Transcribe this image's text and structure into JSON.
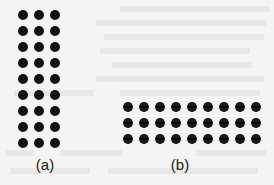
{
  "figure": {
    "background_color": "#f5f4f2",
    "dot_color": "#121212",
    "label_color": "#1a1a1a",
    "dot_diameter_px": 10,
    "grid_pitch_px": 16,
    "panels": [
      {
        "id": "a",
        "label": "(a)",
        "rows": 9,
        "columns": 3,
        "total_dots": 27,
        "origin_x": 15,
        "origin_y": 7,
        "label_center_x": 45,
        "label_y": 157
      },
      {
        "id": "b",
        "label": "(b)",
        "rows": 3,
        "columns": 9,
        "total_dots": 27,
        "origin_x": 120,
        "origin_y": 99,
        "label_center_x": 180,
        "label_y": 157
      }
    ]
  },
  "chart_data": {
    "type": "scatter",
    "title": "",
    "subtitle": "",
    "xlabel": "",
    "ylabel": "",
    "grid": false,
    "legend_position": "none",
    "panels": [
      {
        "name": "(a)",
        "rows": 9,
        "columns": 3,
        "count": 27,
        "annotation": "(a)"
      },
      {
        "name": "(b)",
        "rows": 3,
        "columns": 9,
        "count": 27,
        "annotation": "(b)"
      }
    ],
    "categories": [
      "(a)",
      "(b)"
    ],
    "values": [
      27,
      27
    ]
  },
  "bleed_marks": [
    {
      "x": 120,
      "y": 6,
      "w": 150
    },
    {
      "x": 96,
      "y": 20,
      "w": 170
    },
    {
      "x": 104,
      "y": 34,
      "w": 160
    },
    {
      "x": 100,
      "y": 48,
      "w": 150
    },
    {
      "x": 112,
      "y": 62,
      "w": 140
    },
    {
      "x": 96,
      "y": 76,
      "w": 168
    },
    {
      "x": 14,
      "y": 90,
      "w": 80
    },
    {
      "x": 120,
      "y": 90,
      "w": 140
    },
    {
      "x": 6,
      "y": 150,
      "w": 28
    },
    {
      "x": 60,
      "y": 150,
      "w": 62
    },
    {
      "x": 196,
      "y": 150,
      "w": 70
    },
    {
      "x": 10,
      "y": 168,
      "w": 80
    },
    {
      "x": 108,
      "y": 168,
      "w": 150
    }
  ]
}
